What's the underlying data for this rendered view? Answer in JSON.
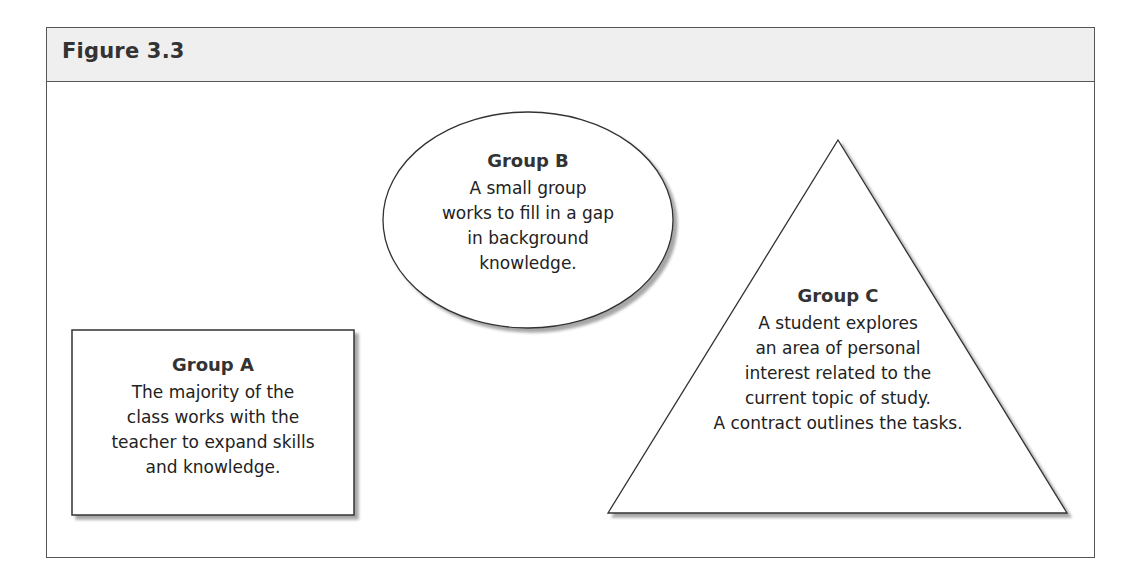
{
  "figure": {
    "title": "Figure 3.3"
  },
  "groups": [
    {
      "id": "A",
      "shape": "rectangle",
      "title": "Group A",
      "lines": [
        "The majority of the",
        "class works with the",
        "teacher to expand skills",
        "and knowledge."
      ]
    },
    {
      "id": "B",
      "shape": "ellipse",
      "title": "Group B",
      "lines": [
        "A small group",
        "works to fill in a gap",
        "in background",
        "knowledge."
      ]
    },
    {
      "id": "C",
      "shape": "triangle",
      "title": "Group C",
      "lines": [
        "A student explores",
        "an area of personal",
        "interest related to the",
        "current topic of study.",
        "A contract outlines the tasks."
      ]
    }
  ],
  "colors": {
    "header_bg": "#efefef",
    "border": "#555555",
    "shadow": "#bbbbbb",
    "text": "#222222"
  }
}
